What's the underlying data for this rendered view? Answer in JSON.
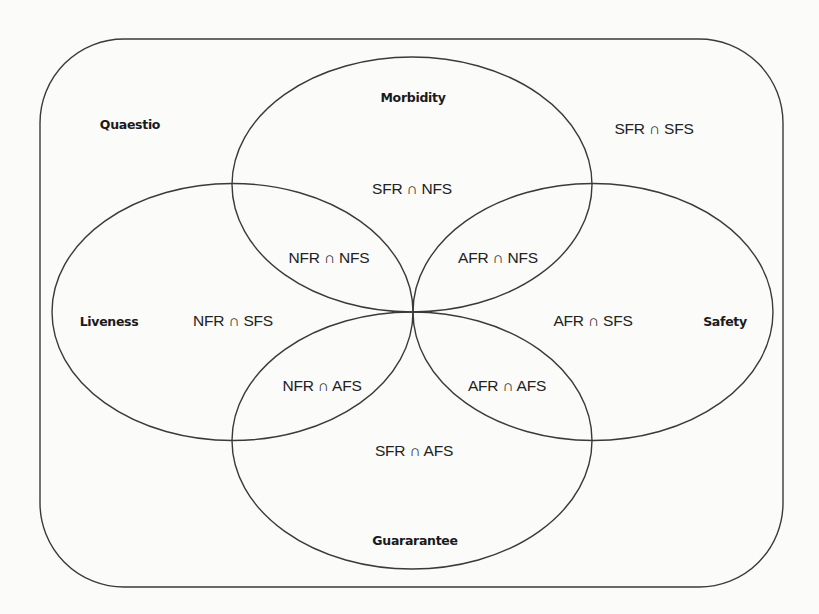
{
  "diagram": {
    "type": "venn",
    "colors": {
      "stroke": "#3a3a3a",
      "text": "#1a1a1a",
      "background": "#fbfbfa"
    },
    "universe": {
      "label": "Quaestio"
    },
    "sets": {
      "top": {
        "label": "Morbidity"
      },
      "left": {
        "label": "Liveness"
      },
      "right": {
        "label": "Safety"
      },
      "bottom": {
        "label": "Guararantee"
      }
    },
    "regions": {
      "outside": "SFR ∩ SFS",
      "top_only": "SFR ∩ NFS",
      "top_left": "NFR ∩ NFS",
      "top_right": "AFR ∩ NFS",
      "left_only": "NFR ∩ SFS",
      "right_only": "AFR ∩ SFS",
      "bottom_left": "NFR ∩ AFS",
      "bottom_right": "AFR ∩ AFS",
      "bottom_only": "SFR ∩ AFS"
    }
  }
}
